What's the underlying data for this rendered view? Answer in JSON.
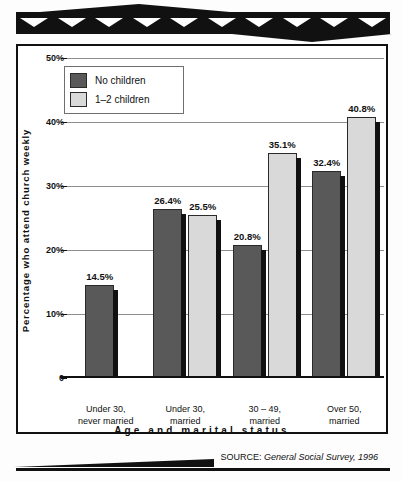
{
  "chart_data": {
    "type": "bar",
    "title": "",
    "xlabel": "Age and marital status",
    "ylabel": "Percentage who attend church weekly",
    "ylim": [
      0,
      50
    ],
    "grid": true,
    "legend_position": "top-left",
    "ytick_labels": [
      "0",
      "10%",
      "20%",
      "30%",
      "40%",
      "50%"
    ],
    "ytick_values": [
      0,
      10,
      20,
      30,
      40,
      50
    ],
    "categories": [
      "Under 30,\nnever married",
      "Under 30,\nmarried",
      "30 – 49,\nmarried",
      "Over 50,\nmarried"
    ],
    "category_lines": [
      [
        "Under 30,",
        "never married"
      ],
      [
        "Under 30,",
        "married"
      ],
      [
        "30 – 49,",
        "married"
      ],
      [
        "Over 50,",
        "married"
      ]
    ],
    "series": [
      {
        "name": "No children",
        "color": "#595959",
        "values": [
          14.5,
          26.4,
          20.8,
          32.4
        ],
        "value_labels": [
          "14.5%",
          "26.4%",
          "20.8%",
          "32.4%"
        ]
      },
      {
        "name": "1–2 children",
        "color": "#d9d9d9",
        "values": [
          null,
          25.5,
          35.1,
          40.8
        ],
        "value_labels": [
          null,
          "25.5%",
          "35.1%",
          "40.8%"
        ]
      }
    ],
    "source": {
      "label": "SOURCE:",
      "text": "General Social Survey, 1996"
    }
  },
  "legend": {
    "items": [
      {
        "label": "No children",
        "color": "#595959"
      },
      {
        "label": "1–2 children",
        "color": "#d9d9d9"
      }
    ]
  },
  "colors": {
    "ink": "#111111",
    "grid": "#8f8f8f",
    "no_children": "#595959",
    "one_two_children": "#d9d9d9"
  }
}
